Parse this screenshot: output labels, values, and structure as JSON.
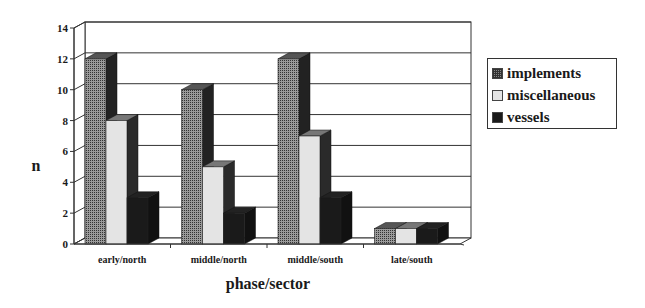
{
  "chart_data": {
    "type": "bar",
    "style": "3d-clustered-column",
    "title": "",
    "xlabel": "phase/sector",
    "ylabel": "n",
    "ylim": [
      0,
      14
    ],
    "yticks": [
      0,
      2,
      4,
      6,
      8,
      10,
      12,
      14
    ],
    "grid": true,
    "legend_position": "right",
    "categories": [
      "early/north",
      "middle/north",
      "middle/south",
      "late/south"
    ],
    "series": [
      {
        "name": "implements",
        "values": [
          12,
          10,
          12,
          1
        ],
        "color": "#7a7a7a",
        "pattern": "crosshatch"
      },
      {
        "name": "miscellaneous",
        "values": [
          8,
          5,
          7,
          1
        ],
        "color": "#e4e4e4",
        "pattern": "solid-light"
      },
      {
        "name": "vessels",
        "values": [
          3,
          2,
          3,
          1
        ],
        "color": "#1a1a1a",
        "pattern": "solid-dark"
      }
    ]
  },
  "legend": {
    "items": [
      {
        "label": "implements"
      },
      {
        "label": "miscellaneous"
      },
      {
        "label": "vessels"
      }
    ]
  },
  "axes": {
    "x_title": "phase/sector",
    "y_title": "n"
  }
}
